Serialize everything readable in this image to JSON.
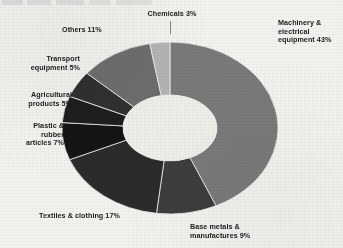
{
  "chart_data": {
    "type": "pie",
    "variant": "donut",
    "title": "",
    "xlabel": "",
    "ylabel": "",
    "units": "percent",
    "legend_position": "outside-callout-labels",
    "grid": false,
    "total": 100,
    "categories": [
      "Machinery & electrical equipment",
      "Base metals & manufactures",
      "Textiles & clothing",
      "Plastic & rubber articles",
      "Agricultural products",
      "Transport equipment",
      "Others",
      "Chemicals"
    ],
    "values": [
      43,
      9,
      17,
      7,
      5,
      5,
      11,
      3
    ],
    "labels": [
      "Machinery &\nelectrical\nequipment 43%",
      "Base metals &\nmanufactures 9%",
      "Textiles & clothing 17%",
      "Plastic &\nrubber\narticles 7%",
      "Agricultural\nproducts 5%",
      "Transport\nequipment 5%",
      "Others 11%",
      "Chemicals 3%"
    ],
    "colors": [
      "#7a7a7a",
      "#3d3d3d",
      "#2b2b2b",
      "#141414",
      "#1e1e1e",
      "#303030",
      "#6e6e6e",
      "#b4b4b4"
    ],
    "hole_color": "#efeee9"
  },
  "labels": {
    "chemicals": "Chemicals 3%",
    "others": "Others 11%",
    "machinery": "Machinery &\nelectrical\nequipment 43%",
    "transport": "Transport\nequipment 5%",
    "agricultural": "Agricultural\nproducts 5%",
    "plastic": "Plastic &\nrubber\narticles 7%",
    "textiles": "Textiles & clothing 17%",
    "base_metals": "Base metals &\nmanufactures 9%"
  }
}
